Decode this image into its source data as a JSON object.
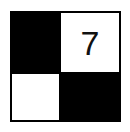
{
  "puzzle": {
    "rows": 2,
    "cols": 2,
    "cells": [
      {
        "row": 0,
        "col": 0,
        "fill": "black",
        "value": ""
      },
      {
        "row": 0,
        "col": 1,
        "fill": "white",
        "value": "7"
      },
      {
        "row": 1,
        "col": 0,
        "fill": "white",
        "value": ""
      },
      {
        "row": 1,
        "col": 1,
        "fill": "black",
        "value": ""
      }
    ]
  },
  "colors": {
    "filled": "#000000",
    "empty": "#ffffff"
  }
}
